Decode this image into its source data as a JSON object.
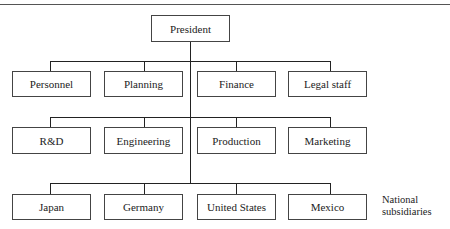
{
  "diagram": {
    "type": "org-chart",
    "root": {
      "label": "President"
    },
    "rows": [
      {
        "name": "staff",
        "items": [
          {
            "label": "Personnel"
          },
          {
            "label": "Planning"
          },
          {
            "label": "Finance"
          },
          {
            "label": "Legal staff"
          }
        ]
      },
      {
        "name": "functions",
        "items": [
          {
            "label": "R&D"
          },
          {
            "label": "Engineering"
          },
          {
            "label": "Production"
          },
          {
            "label": "Marketing"
          }
        ]
      },
      {
        "name": "subsidiaries",
        "items": [
          {
            "label": "Japan"
          },
          {
            "label": "Germany"
          },
          {
            "label": "United States"
          },
          {
            "label": "Mexico"
          }
        ],
        "side_label_line1": "National",
        "side_label_line2": "subsidiaries"
      }
    ]
  }
}
